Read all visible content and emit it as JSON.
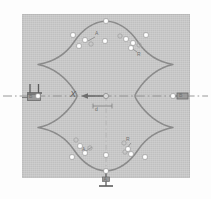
{
  "figure": {
    "type": "roundness-profile-inspection-diagram",
    "panel_background": "#c6c6c6",
    "trace_color": "#8a8a8a",
    "centerline_color": "#8d8d8d",
    "marker_fill": "#ffffff",
    "marker_stroke": "#8d8d8d"
  },
  "labels": {
    "axis_x": "X",
    "center_dimension": "d",
    "top_annotation": "A",
    "upper_right_annotation": "R",
    "lower_left_annotation": "A",
    "lower_right_annotation": "R",
    "right_datum": "B",
    "left_control_frame": "B",
    "bottom_datum": "A",
    "perpendicularity_symbol": "⊥",
    "datum_symbol": "⊥"
  },
  "chart_data": {
    "type": "line",
    "xlabel": "X",
    "ylabel": "",
    "grid": false,
    "legend": null,
    "profile": {
      "name": "four-lobed roundness trace",
      "center": [
        106,
        96
      ],
      "lobes": 4,
      "max_radius": 68,
      "min_radius": 52
    },
    "measurement_points": [
      {
        "id": 1,
        "x": 106,
        "y": 21,
        "region": "top-apex"
      },
      {
        "id": 2,
        "x": 73,
        "y": 35,
        "region": "upper-left"
      },
      {
        "id": 3,
        "x": 85,
        "y": 40,
        "region": "upper-left"
      },
      {
        "id": 4,
        "x": 79,
        "y": 46,
        "region": "upper-left"
      },
      {
        "id": 5,
        "x": 105,
        "y": 41,
        "region": "upper-center"
      },
      {
        "id": 6,
        "x": 126,
        "y": 39,
        "region": "upper-right"
      },
      {
        "id": 7,
        "x": 133,
        "y": 43,
        "region": "upper-right"
      },
      {
        "id": 8,
        "x": 131,
        "y": 48,
        "region": "upper-right"
      },
      {
        "id": 9,
        "x": 146,
        "y": 35,
        "region": "upper-right"
      },
      {
        "id": 10,
        "x": 38,
        "y": 96,
        "region": "left-vertex"
      },
      {
        "id": 11,
        "x": 173,
        "y": 96,
        "region": "right-vertex"
      },
      {
        "id": 12,
        "x": 106,
        "y": 171,
        "region": "bottom-apex"
      },
      {
        "id": 13,
        "x": 80,
        "y": 146,
        "region": "lower-left"
      },
      {
        "id": 14,
        "x": 85,
        "y": 153,
        "region": "lower-left"
      },
      {
        "id": 15,
        "x": 72,
        "y": 157,
        "region": "lower-left"
      },
      {
        "id": 16,
        "x": 106,
        "y": 155,
        "region": "lower-center"
      },
      {
        "id": 17,
        "x": 128,
        "y": 149,
        "region": "lower-right"
      },
      {
        "id": 18,
        "x": 131,
        "y": 154,
        "region": "lower-right"
      },
      {
        "id": 19,
        "x": 145,
        "y": 157,
        "region": "lower-right"
      },
      {
        "id": 20,
        "x": 106,
        "y": 96,
        "region": "center"
      }
    ],
    "annotations": [
      {
        "text": "X",
        "x": 74,
        "y": 92,
        "note": "axis label"
      },
      {
        "text": "d",
        "x": 96,
        "y": 105,
        "note": "center dimension"
      },
      {
        "text": "A",
        "x": 97,
        "y": 34,
        "note": "top feature callout"
      },
      {
        "text": "R",
        "x": 138,
        "y": 55,
        "note": "upper right callout"
      },
      {
        "text": "A",
        "x": 83,
        "y": 150,
        "note": "lower left callout"
      },
      {
        "text": "R",
        "x": 127,
        "y": 140,
        "note": "lower right callout"
      }
    ],
    "centerline": {
      "y": 96,
      "x_start": 3,
      "x_end": 208,
      "style": "dash-dot"
    },
    "arrow": {
      "from": [
        105,
        96
      ],
      "to": [
        81,
        96
      ],
      "direction": "left"
    }
  }
}
